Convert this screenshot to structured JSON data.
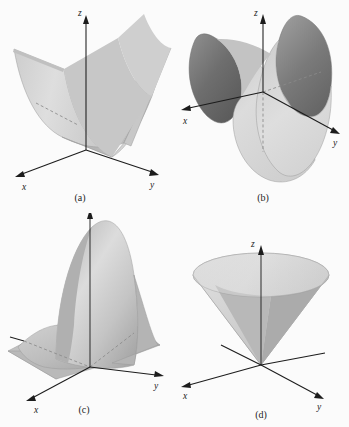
{
  "figure": {
    "background_color": "#fbfbfb",
    "ink_color": "#1c1c1c",
    "panel_count": 4
  },
  "panels": [
    {
      "id": "a",
      "caption": "(a)",
      "surface_name": "parabolic-cylinder",
      "surface_description": "Parabolic trough opening upward, extended along the y-axis",
      "axes": {
        "x": "x",
        "y": "y",
        "z": "z"
      },
      "colors": {
        "light": "#d9d9d9",
        "mid": "#c2c2c2",
        "dark": "#a8a8a8"
      }
    },
    {
      "id": "b",
      "caption": "(b)",
      "surface_name": "hyperbolic-paraboloid",
      "surface_description": "Saddle surface rising along x and falling along y",
      "axes": {
        "x": "x",
        "y": "y",
        "z": "z"
      },
      "colors": {
        "light": "#dcdcdc",
        "mid": "#b4b4b4",
        "dark": "#6d6d6d"
      }
    },
    {
      "id": "c",
      "caption": "(c)",
      "surface_name": "gaussian-bump",
      "surface_description": "Bell shaped peak with a smaller secondary bump on a flat base plane",
      "axes": {
        "x": "x",
        "y": "y",
        "z": "z"
      },
      "colors": {
        "light": "#d5d5d5",
        "mid": "#bdbdbd",
        "dark": "#a0a0a0"
      }
    },
    {
      "id": "d",
      "caption": "(d)",
      "surface_name": "cone",
      "surface_description": "Circular cone opening upward from the origin",
      "axes": {
        "x": "x",
        "y": "y",
        "z": "z"
      },
      "colors": {
        "light": "#dcdcdc",
        "mid": "#bcbcbc",
        "dark": "#9d9d9d"
      }
    }
  ]
}
